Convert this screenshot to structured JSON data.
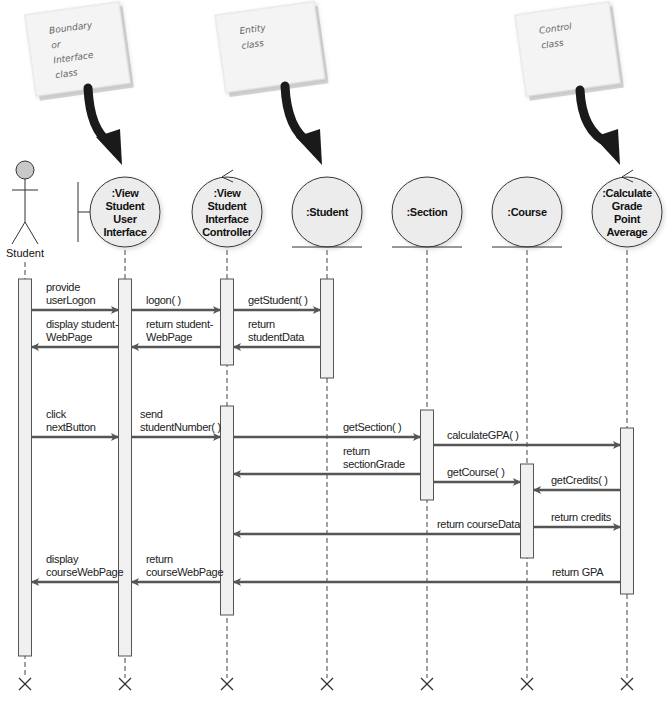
{
  "notes": [
    {
      "id": "boundary",
      "lines": [
        "Boundary",
        "or",
        "Interface",
        "class"
      ],
      "x": 30,
      "y": 8,
      "w": 95,
      "h": 82,
      "rot": -8,
      "arrow_from": [
        88,
        88
      ],
      "arrow_to": [
        122,
        165
      ]
    },
    {
      "id": "entity",
      "lines": [
        "Entity",
        "class"
      ],
      "x": 220,
      "y": 8,
      "w": 100,
      "h": 78,
      "rot": -8,
      "arrow_from": [
        285,
        86
      ],
      "arrow_to": [
        322,
        165
      ]
    },
    {
      "id": "control",
      "lines": [
        "Control",
        "class"
      ],
      "x": 520,
      "y": 8,
      "w": 95,
      "h": 82,
      "rot": -8,
      "arrow_from": [
        580,
        90
      ],
      "arrow_to": [
        620,
        165
      ]
    }
  ],
  "lifelines": [
    {
      "id": "student",
      "kind": "actor",
      "label": [
        "Student"
      ],
      "x": 25
    },
    {
      "id": "view-ui",
      "kind": "boundary",
      "label": [
        ":View",
        "Student",
        "User",
        "Interface"
      ],
      "x": 125
    },
    {
      "id": "controller",
      "kind": "control",
      "label": [
        ":View",
        "Student",
        "Interface",
        "Controller"
      ],
      "x": 227
    },
    {
      "id": "student-obj",
      "kind": "entity",
      "label": [
        ":Student"
      ],
      "x": 327
    },
    {
      "id": "section",
      "kind": "entity",
      "label": [
        ":Section"
      ],
      "x": 427
    },
    {
      "id": "course",
      "kind": "entity",
      "label": [
        ":Course"
      ],
      "x": 527
    },
    {
      "id": "gpa",
      "kind": "control",
      "label": [
        ":Calculate",
        "Grade",
        "Point",
        "Average"
      ],
      "x": 627
    }
  ],
  "activations": [
    {
      "lifeline": 0,
      "y1": 279,
      "y2": 656
    },
    {
      "lifeline": 1,
      "y1": 279,
      "y2": 656
    },
    {
      "lifeline": 2,
      "y1": 279,
      "y2": 365
    },
    {
      "lifeline": 3,
      "y1": 279,
      "y2": 378
    },
    {
      "lifeline": 2,
      "y1": 406,
      "y2": 615
    },
    {
      "lifeline": 4,
      "y1": 410,
      "y2": 500
    },
    {
      "lifeline": 6,
      "y1": 428,
      "y2": 594
    },
    {
      "lifeline": 5,
      "y1": 464,
      "y2": 558
    }
  ],
  "messages": [
    {
      "from": 0,
      "to": 1,
      "y": 310,
      "label": [
        "provide",
        "userLogon"
      ],
      "label_x": 46
    },
    {
      "from": 1,
      "to": 2,
      "y": 310,
      "label": [
        "logon( )"
      ],
      "label_x": 146
    },
    {
      "from": 2,
      "to": 3,
      "y": 310,
      "label": [
        "getStudent( )"
      ],
      "label_x": 248
    },
    {
      "from": 1,
      "to": 0,
      "y": 347,
      "label": [
        "display student-",
        "WebPage"
      ],
      "label_x": 46
    },
    {
      "from": 2,
      "to": 1,
      "y": 347,
      "label": [
        "return student-",
        "WebPage"
      ],
      "label_x": 146
    },
    {
      "from": 3,
      "to": 2,
      "y": 347,
      "label": [
        "return",
        "studentData"
      ],
      "label_x": 248
    },
    {
      "from": 0,
      "to": 1,
      "y": 437,
      "label": [
        "click",
        "nextButton"
      ],
      "label_x": 46
    },
    {
      "from": 1,
      "to": 2,
      "y": 437,
      "label": [
        "send",
        "studentNumber( )"
      ],
      "label_x": 140
    },
    {
      "from": 2,
      "to": 4,
      "y": 437,
      "label": [
        "getSection( )"
      ],
      "label_x": 343
    },
    {
      "from": 4,
      "to": 6,
      "y": 445,
      "label": [
        "calculateGPA( )"
      ],
      "label_x": 447
    },
    {
      "from": 4,
      "to": 2,
      "y": 474,
      "label": [
        "return",
        "sectionGrade"
      ],
      "label_x": 343
    },
    {
      "from": 4,
      "to": 5,
      "y": 482,
      "label": [
        "getCourse( )"
      ],
      "label_x": 447
    },
    {
      "from": 6,
      "to": 5,
      "y": 490,
      "label": [
        "getCredits( )"
      ],
      "label_x": 551
    },
    {
      "from": 5,
      "to": 6,
      "y": 527,
      "label": [
        "return credits"
      ],
      "label_x": 551
    },
    {
      "from": 5,
      "to": 2,
      "y": 534,
      "label": [
        "return courseData"
      ],
      "label_x": 437
    },
    {
      "from": 1,
      "to": 0,
      "y": 582,
      "label": [
        "display",
        "courseWebPage"
      ],
      "label_x": 46
    },
    {
      "from": 2,
      "to": 1,
      "y": 582,
      "label": [
        "return",
        "courseWebPage"
      ],
      "label_x": 146
    },
    {
      "from": 6,
      "to": 2,
      "y": 582,
      "label": [
        "return GPA"
      ],
      "label_x": 552
    }
  ],
  "layout": {
    "head_cy": 212,
    "head_r": 35,
    "lifeline_top": 250,
    "lifeline_bottom": 678,
    "destroy_y": 684
  },
  "colors": {
    "note_fill": "#f4f4f4",
    "note_shadow": "#d6d6d6",
    "arrow_black": "#1a1a1a",
    "circle_fill": "#ececec",
    "actor_head": "#c8c8c8"
  }
}
